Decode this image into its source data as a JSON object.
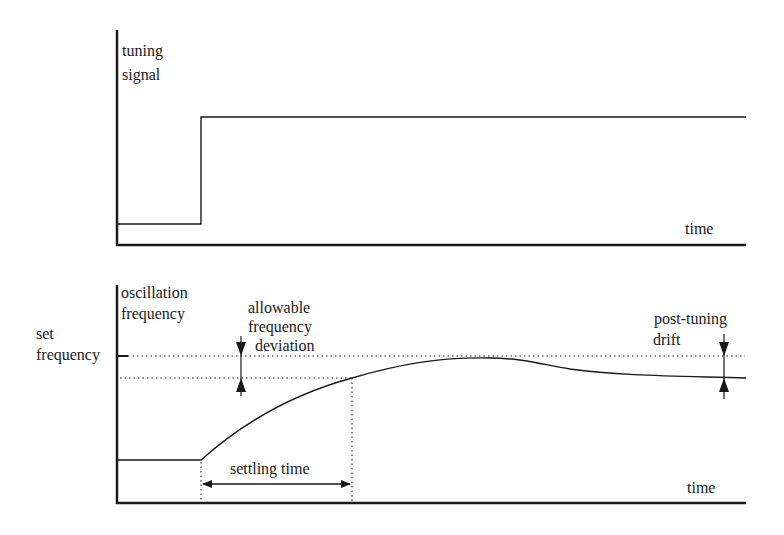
{
  "top_panel": {
    "y_label_line1": "tuning",
    "y_label_line2": "signal",
    "x_label": "time"
  },
  "bottom_panel": {
    "y_label_line1": "oscillation",
    "y_label_line2": "frequency",
    "x_label": "time",
    "set_frequency_line1": "set",
    "set_frequency_line2": "frequency",
    "allowable_line1": "allowable",
    "allowable_line2": "frequency",
    "allowable_line3": "deviation",
    "drift_line1": "post-tuning",
    "drift_line2": "drift",
    "settling_label": "settling time"
  },
  "colors": {
    "line": "#1a1a1a",
    "background": "#ffffff"
  }
}
